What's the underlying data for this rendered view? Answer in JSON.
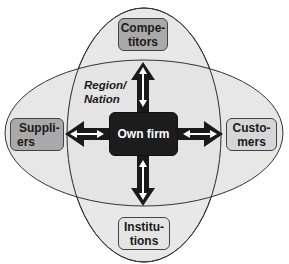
{
  "diagram": {
    "center": {
      "label": "Own firm",
      "color": "#1c1c1c"
    },
    "nodes": [
      {
        "id": "competitors",
        "line1": "Compe-",
        "line2": "titors",
        "color": "#a9a9a9",
        "position": "top"
      },
      {
        "id": "suppliers",
        "line1": "Suppli-",
        "line2": "ers",
        "color": "#a9a9a9",
        "position": "left"
      },
      {
        "id": "customers",
        "line1": "Custo-",
        "line2": "mers",
        "color": "#d6d6d6",
        "position": "right"
      },
      {
        "id": "institutions",
        "line1": "Institu-",
        "line2": "tions",
        "color": "#e4e4e4",
        "position": "bottom"
      }
    ],
    "region_label": {
      "line1": "Region/",
      "line2": "Nation"
    },
    "colors": {
      "ellipse_fill": "#e6e6e6",
      "ellipse_stroke": "#333333",
      "arrow": "#1a1a1a",
      "arrow_inner": "#ffffff"
    }
  }
}
